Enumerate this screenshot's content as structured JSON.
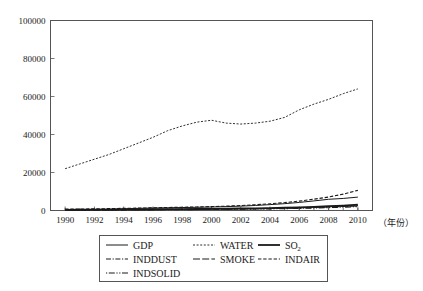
{
  "figure": {
    "background_color": "#ffffff",
    "ink_color": "#1a1a1a",
    "frame_color": "#555555",
    "x_axis_caption": "（年份）"
  },
  "chart_data": {
    "type": "line",
    "title": "",
    "xlabel": "（年份）",
    "ylabel": "",
    "xlim": [
      1989,
      2011
    ],
    "ylim": [
      0,
      100000
    ],
    "grid": false,
    "legend_position": "bottom-outside",
    "ytick_labels": [
      "0",
      "20000",
      "40000",
      "60000",
      "80000",
      "100000"
    ],
    "ytick_values": [
      0,
      20000,
      40000,
      60000,
      80000,
      100000
    ],
    "xtick_labels": [
      "1990",
      "1992",
      "1994",
      "1996",
      "1998",
      "2000",
      "2002",
      "2004",
      "2006",
      "2008",
      "2010"
    ],
    "xtick_values": [
      1990,
      1992,
      1994,
      1996,
      1998,
      2000,
      2002,
      2004,
      2006,
      2008,
      2010
    ],
    "x": [
      1990,
      1991,
      1992,
      1993,
      1994,
      1995,
      1996,
      1997,
      1998,
      1999,
      2000,
      2001,
      2002,
      2003,
      2004,
      2005,
      2006,
      2007,
      2008,
      2009,
      2010
    ],
    "series": [
      {
        "name": "GDP",
        "label": "GDP",
        "linestyle": "solid",
        "dasharray": "",
        "width": 1.0,
        "values": [
          420,
          470,
          560,
          700,
          900,
          1120,
          1300,
          1450,
          1560,
          1680,
          1850,
          2050,
          2300,
          2650,
          3100,
          3600,
          4250,
          5050,
          5900,
          6350,
          7050
        ]
      },
      {
        "name": "WATER",
        "label": "WATER",
        "linestyle": "dotted",
        "dasharray": "2,1.6",
        "width": 0.9,
        "values": [
          22000,
          24500,
          27000,
          29500,
          32500,
          35500,
          38500,
          42000,
          44500,
          46500,
          47500,
          46000,
          45500,
          46000,
          47000,
          49000,
          53000,
          56000,
          58500,
          61500,
          64000
        ]
      },
      {
        "name": "SO2",
        "label": "SO",
        "label_sub": "2",
        "linestyle": "solid-thick",
        "dasharray": "",
        "width": 1.8,
        "values": [
          350,
          390,
          430,
          480,
          540,
          600,
          660,
          720,
          760,
          800,
          860,
          940,
          1040,
          1160,
          1300,
          1470,
          1680,
          1950,
          2250,
          2600,
          3050
        ]
      },
      {
        "name": "INDDUST",
        "label": "INDDUST",
        "linestyle": "dashdot",
        "dasharray": "5,1.6,1.2,1.6",
        "width": 1.0,
        "values": [
          300,
          330,
          360,
          400,
          450,
          500,
          560,
          620,
          670,
          720,
          780,
          850,
          940,
          1050,
          1180,
          1340,
          1530,
          1760,
          2020,
          2300,
          2650
        ]
      },
      {
        "name": "SMOKE",
        "label": "SMOKE",
        "linestyle": "longdash",
        "dasharray": "7,2.2",
        "width": 1.2,
        "values": [
          260,
          290,
          320,
          350,
          390,
          430,
          480,
          530,
          580,
          630,
          690,
          760,
          840,
          940,
          1060,
          1200,
          1380,
          1600,
          1860,
          2150,
          2500
        ]
      },
      {
        "name": "INDAIR",
        "label": "INDAIR",
        "linestyle": "dashed",
        "dasharray": "3.4,1.8",
        "width": 1.1,
        "values": [
          700,
          790,
          880,
          990,
          1120,
          1260,
          1410,
          1570,
          1720,
          1880,
          2060,
          2300,
          2620,
          3020,
          3520,
          4150,
          4950,
          5950,
          7100,
          8600,
          10600
        ]
      },
      {
        "name": "INDSOLID",
        "label": "INDSOLID",
        "linestyle": "dashdotdot",
        "dasharray": "1.2,1.6,6,1.6,1.2,1.6",
        "width": 1.2,
        "values": [
          200,
          225,
          250,
          280,
          315,
          350,
          390,
          430,
          470,
          510,
          560,
          620,
          690,
          780,
          880,
          1000,
          1150,
          1330,
          1540,
          1780,
          2080
        ]
      }
    ],
    "legend_rows": [
      [
        "GDP",
        "WATER",
        "SO2"
      ],
      [
        "INDDUST",
        "SMOKE",
        "INDAIR"
      ],
      [
        "INDSOLID"
      ]
    ]
  }
}
